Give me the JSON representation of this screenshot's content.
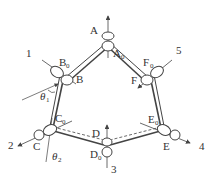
{
  "diagram": {
    "type": "mechanism-linkage",
    "colors": {
      "stroke": "#444444",
      "text": "#333333",
      "background": "#ffffff"
    },
    "joints": [
      {
        "id": "A",
        "label": "A",
        "sub": "",
        "x": 108,
        "y": 35
      },
      {
        "id": "A0",
        "label": "A",
        "sub": "0",
        "x": 108,
        "y": 46
      },
      {
        "id": "B0",
        "label": "B",
        "sub": "0",
        "x": 57,
        "y": 72
      },
      {
        "id": "B",
        "label": "B",
        "sub": "",
        "x": 67,
        "y": 80
      },
      {
        "id": "F0",
        "label": "F",
        "sub": "0",
        "x": 157,
        "y": 72
      },
      {
        "id": "F",
        "label": "F",
        "sub": "",
        "x": 147,
        "y": 80
      },
      {
        "id": "C0",
        "label": "C",
        "sub": "0",
        "x": 50,
        "y": 130
      },
      {
        "id": "C",
        "label": "C",
        "sub": "",
        "x": 40,
        "y": 137
      },
      {
        "id": "E0",
        "label": "E",
        "sub": "0",
        "x": 164,
        "y": 130
      },
      {
        "id": "E",
        "label": "E",
        "sub": "",
        "x": 174,
        "y": 137
      },
      {
        "id": "D",
        "label": "D",
        "sub": "",
        "x": 107,
        "y": 140
      },
      {
        "id": "D0",
        "label": "D",
        "sub": "0",
        "x": 107,
        "y": 153
      }
    ],
    "axis_labels": [
      {
        "id": "1",
        "text": "1"
      },
      {
        "id": "2",
        "text": "2"
      },
      {
        "id": "3",
        "text": "3"
      },
      {
        "id": "4",
        "text": "4"
      },
      {
        "id": "5",
        "text": "5"
      }
    ],
    "angles": [
      {
        "id": "theta1",
        "symbol": "θ",
        "sub": "1"
      },
      {
        "id": "theta2",
        "symbol": "θ",
        "sub": "2"
      }
    ]
  }
}
